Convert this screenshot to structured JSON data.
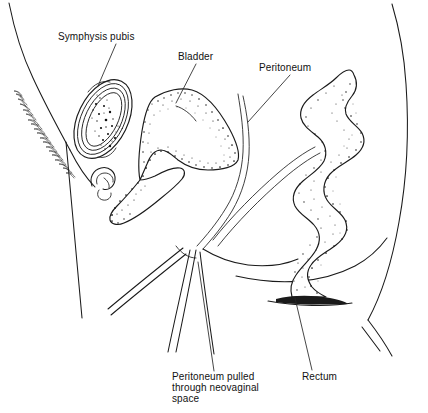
{
  "figure": {
    "background_color": "#ffffff",
    "ink_color": "#1a1a1a",
    "width": 428,
    "height": 413
  },
  "labels": [
    {
      "id": "symphysis-pubis",
      "text": "Symphysis pubis",
      "x": 58,
      "y": 40,
      "anchor": "start",
      "leader": "M 116,44 L 98,86"
    },
    {
      "id": "bladder",
      "text": "Bladder",
      "x": 178,
      "y": 60,
      "anchor": "start",
      "leader": "M 196,64 L 176,103"
    },
    {
      "id": "peritoneum",
      "text": "Peritoneum",
      "x": 259,
      "y": 71,
      "anchor": "start",
      "leader": "M 290,75 L 248,122"
    },
    {
      "id": "rectum",
      "text": "Rectum",
      "x": 302,
      "y": 380,
      "anchor": "start",
      "leader": "M 312,370 L 295,298"
    }
  ],
  "multiline_labels": [
    {
      "id": "peritoneum-pulled",
      "x": 172,
      "y": 380,
      "line_height": 11,
      "lines": [
        "Peritoneum pulled",
        "through neovaginal",
        "space"
      ],
      "leader": "M 214,371 L 198,262"
    }
  ],
  "anatomy": {
    "structures": [
      {
        "id": "abdominal-wall-outline",
        "name": "anterior abdominal wall"
      },
      {
        "id": "pubic-hair",
        "name": "pubic hair hatching"
      },
      {
        "id": "symphysis-pubis-bone",
        "name": "symphysis pubis with marrow stipple"
      },
      {
        "id": "clitoris",
        "name": "clitoris / external genitalia"
      },
      {
        "id": "bladder-organ",
        "name": "urinary bladder"
      },
      {
        "id": "urethra",
        "name": "urethra"
      },
      {
        "id": "peritoneum-fold",
        "name": "peritoneum double line"
      },
      {
        "id": "neovaginal-space",
        "name": "neovaginal space tract"
      },
      {
        "id": "rectum-organ",
        "name": "rectum"
      },
      {
        "id": "buttock-outline",
        "name": "gluteal / thigh outline"
      }
    ],
    "stipple_seed": 20240917
  }
}
